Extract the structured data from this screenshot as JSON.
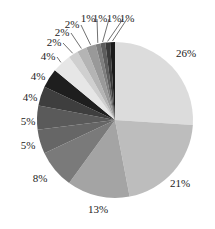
{
  "chart_data": {
    "type": "pie",
    "title": "",
    "start_angle_deg": 0,
    "direction": "clockwise",
    "center": [
      115,
      120
    ],
    "radius": 78,
    "values": [
      26,
      21,
      13,
      8,
      5,
      5,
      4,
      4,
      4,
      2,
      2,
      2,
      1,
      1,
      1,
      1
    ],
    "labels": [
      "26%",
      "21%",
      "13%",
      "8%",
      "5%",
      "5%",
      "4%",
      "4%",
      "4%",
      "2%",
      "2%",
      "2%",
      "1%",
      "1%",
      "1%",
      "1%"
    ],
    "colors": [
      "#dcdcdc",
      "#bdbdbd",
      "#a4a4a4",
      "#7a7a7a",
      "#666666",
      "#5a5a5a",
      "#3e3e3e",
      "#1e1e1e",
      "#e6e6e6",
      "#cfcfcf",
      "#b4b4b4",
      "#999999",
      "#7e7e7e",
      "#5e5e5e",
      "#3a3a3a",
      "#1a1a1a"
    ],
    "label_positions": [
      [
        186,
        57
      ],
      [
        180,
        187
      ],
      [
        98,
        213
      ],
      [
        40,
        182
      ],
      [
        28,
        149
      ],
      [
        28,
        125
      ],
      [
        30,
        101
      ],
      [
        38,
        80
      ],
      [
        48,
        60
      ],
      [
        54,
        46
      ],
      [
        62,
        36
      ],
      [
        72,
        28
      ],
      [
        88,
        22
      ],
      [
        100,
        22
      ],
      [
        114,
        22
      ],
      [
        127,
        22
      ]
    ],
    "leader_lines": [
      false,
      false,
      false,
      false,
      false,
      false,
      false,
      false,
      true,
      true,
      true,
      true,
      true,
      true,
      true,
      true
    ],
    "legend": "none",
    "grid": false
  }
}
